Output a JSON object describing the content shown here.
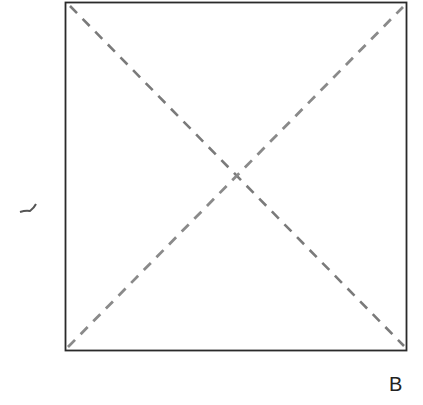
{
  "diagram": {
    "square": {
      "x": 65,
      "y": 2,
      "width": 341,
      "height": 348,
      "stroke": "#2a2a2a"
    },
    "diagonals": [
      {
        "name": "top-left-to-bottom-right",
        "x1": 70,
        "y1": 6,
        "x2": 404,
        "y2": 346,
        "stroke": "#7a7a7a"
      },
      {
        "name": "bottom-left-to-top-right",
        "x1": 68,
        "y1": 347,
        "x2": 403,
        "y2": 7,
        "stroke": "#8a8a8a"
      }
    ],
    "labels": {
      "corner_label": "B"
    }
  }
}
